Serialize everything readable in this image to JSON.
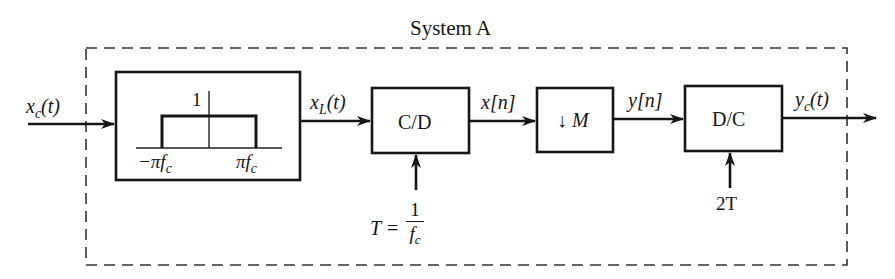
{
  "title": "System A",
  "input_signal": {
    "base": "x",
    "sub": "c",
    "arg": "(t)"
  },
  "lowpass_filter": {
    "gain_label": "1",
    "left_cutoff": {
      "base": "−πf",
      "sub": "c"
    },
    "right_cutoff": {
      "base": "πf",
      "sub": "c"
    }
  },
  "filtered_signal": {
    "base": "x",
    "sub": "L",
    "arg": "(t)"
  },
  "cd_block": {
    "label": "C/D",
    "param_lhs": "T =",
    "param_num": "1",
    "param_den_base": "f",
    "param_den_sub": "c"
  },
  "sampled_signal": "x[n]",
  "downsampler_block": {
    "arrow": "↓",
    "label": "M"
  },
  "downsampled_signal": "y[n]",
  "dc_block": {
    "label": "D/C",
    "param": "2T"
  },
  "output_signal": {
    "base": "y",
    "sub": "c",
    "arg": "(t)"
  },
  "colors": {
    "stroke": "#161616",
    "background": "#ffffff",
    "dashed_border": "#333333"
  }
}
